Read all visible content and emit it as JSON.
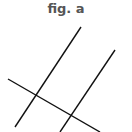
{
  "title": "fig. a",
  "colors": {
    "line": "#111111",
    "title": "#555555"
  },
  "lines": [
    {
      "name": "parallel-line-1",
      "x1": 81,
      "y1": 27,
      "x2": 15,
      "y2": 127
    },
    {
      "name": "parallel-line-2",
      "x1": 115,
      "y1": 50,
      "x2": 60,
      "y2": 132
    },
    {
      "name": "transversal",
      "x1": 8,
      "y1": 79,
      "x2": 100,
      "y2": 132
    }
  ]
}
